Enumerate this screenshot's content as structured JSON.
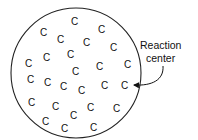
{
  "diagram": {
    "circle": {
      "cx": 76,
      "cy": 73,
      "r": 65
    },
    "molecule_symbol": "C",
    "molecules": [
      {
        "x": 74,
        "y": 25
      },
      {
        "x": 43,
        "y": 36
      },
      {
        "x": 101,
        "y": 33
      },
      {
        "x": 60,
        "y": 43
      },
      {
        "x": 86,
        "y": 46
      },
      {
        "x": 113,
        "y": 51
      },
      {
        "x": 28,
        "y": 67
      },
      {
        "x": 46,
        "y": 61
      },
      {
        "x": 70,
        "y": 58
      },
      {
        "x": 99,
        "y": 70
      },
      {
        "x": 127,
        "y": 68
      },
      {
        "x": 75,
        "y": 75
      },
      {
        "x": 30,
        "y": 83
      },
      {
        "x": 47,
        "y": 86
      },
      {
        "x": 63,
        "y": 90
      },
      {
        "x": 81,
        "y": 94
      },
      {
        "x": 104,
        "y": 89
      },
      {
        "x": 124,
        "y": 89
      },
      {
        "x": 31,
        "y": 106
      },
      {
        "x": 55,
        "y": 110
      },
      {
        "x": 90,
        "y": 111
      },
      {
        "x": 116,
        "y": 112
      },
      {
        "x": 73,
        "y": 119
      },
      {
        "x": 45,
        "y": 125
      },
      {
        "x": 64,
        "y": 132
      },
      {
        "x": 93,
        "y": 131
      }
    ],
    "label": {
      "line1": "Reaction",
      "line2": "center"
    },
    "arrow_target_index": 17
  }
}
